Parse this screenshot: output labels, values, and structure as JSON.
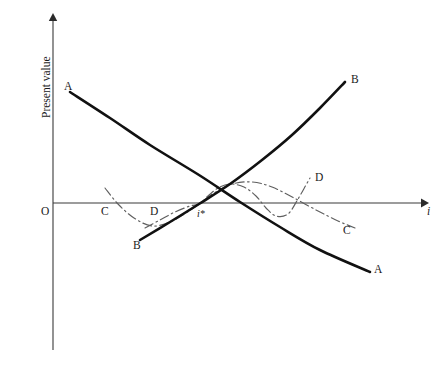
{
  "figure": {
    "name": "present-value-vs-interest-rate-diagram",
    "background_color": "#ffffff"
  },
  "axes": {
    "y_label": "Present value",
    "x_label": "i",
    "origin_label": "O",
    "x_axis_color": "#3a3a3a",
    "y_axis_color": "#3a3a3a",
    "has_arrows": true,
    "grid": false
  },
  "annotations": {
    "crossover_label": "i*",
    "crossover_description": "common crossover rate where all four present-value profiles intersect"
  },
  "curve_labels": {
    "a_left": "A",
    "a_right": "A",
    "b_left": "B",
    "b_right": "B",
    "c_left": "C",
    "c_right": "C",
    "d_left": "D",
    "d_right": "D"
  },
  "chart_data": {
    "type": "line",
    "title": "",
    "subtitle": "",
    "xlabel": "i",
    "ylabel": "Present value",
    "grid": false,
    "legend": "inline curve-end labels",
    "xlim": [
      0,
      447
    ],
    "ylim": [
      -170,
      190
    ],
    "axis_origin_px": [
      53,
      203
    ],
    "x_axis_arrow_tip_px": [
      425,
      203
    ],
    "y_axis_arrow_tip_px": [
      53,
      16
    ],
    "crossover_point_px": [
      199,
      204
    ],
    "series": [
      {
        "name": "A",
        "style": "solid-thick",
        "color": "#111111",
        "description": "Project A: high initial present value at low i, monotonically decreasing convex curve crossing zero just past the crossover rate",
        "points_px": [
          [
            70,
            92
          ],
          [
            110,
            118
          ],
          [
            150,
            145
          ],
          [
            199,
            175
          ],
          [
            240,
            202
          ],
          [
            280,
            227
          ],
          [
            320,
            250
          ],
          [
            370,
            272
          ]
        ],
        "label_start": "A",
        "label_end": "A"
      },
      {
        "name": "B",
        "style": "solid-thick",
        "color": "#111111",
        "description": "Project B: low (negative) present value at low i, monotonically increasing convex curve rising steeply at high i",
        "points_px": [
          [
            140,
            240
          ],
          [
            170,
            222
          ],
          [
            199,
            204
          ],
          [
            230,
            184
          ],
          [
            262,
            160
          ],
          [
            292,
            135
          ],
          [
            320,
            108
          ],
          [
            345,
            82
          ]
        ],
        "label_start": "B",
        "label_end": "B"
      },
      {
        "name": "C",
        "style": "dash-dot-thin",
        "color": "#5f5f5f",
        "description": "Project C: non-monotonic profile starting above the axis, dipping below, rising through the crossover point, then declining below the axis to the right",
        "points_px": [
          [
            105,
            188
          ],
          [
            118,
            204
          ],
          [
            134,
            218
          ],
          [
            152,
            226
          ],
          [
            170,
            222
          ],
          [
            186,
            213
          ],
          [
            199,
            204
          ],
          [
            214,
            193
          ],
          [
            232,
            184
          ],
          [
            252,
            182
          ],
          [
            272,
            187
          ],
          [
            294,
            198
          ],
          [
            318,
            211
          ],
          [
            338,
            221
          ],
          [
            355,
            228
          ]
        ],
        "label_start": "C",
        "label_end": "C"
      },
      {
        "name": "D",
        "style": "dash-dot-thin",
        "color": "#5f5f5f",
        "description": "Project D: non-monotonic profile starting below the axis, rising through the crossover point to a hump above the axis, then declining",
        "points_px": [
          [
            145,
            228
          ],
          [
            160,
            220
          ],
          [
            175,
            212
          ],
          [
            190,
            206
          ],
          [
            199,
            204
          ],
          [
            208,
            196
          ],
          [
            218,
            188
          ],
          [
            230,
            184
          ],
          [
            244,
            187
          ],
          [
            256,
            196
          ],
          [
            266,
            208
          ],
          [
            276,
            216
          ],
          [
            288,
            214
          ],
          [
            298,
            199
          ],
          [
            306,
            185
          ],
          [
            310,
            178
          ]
        ],
        "label_start": "D",
        "label_end": "D"
      }
    ],
    "notes": [
      "All four present-value profiles pass through a single common crossover interest rate labelled i*.",
      "Curves A and B are drawn as heavy solid lines; curves C and D are drawn as light dash-dot lines.",
      "No numeric tick labels are shown on either axis; the figure is schematic."
    ]
  }
}
